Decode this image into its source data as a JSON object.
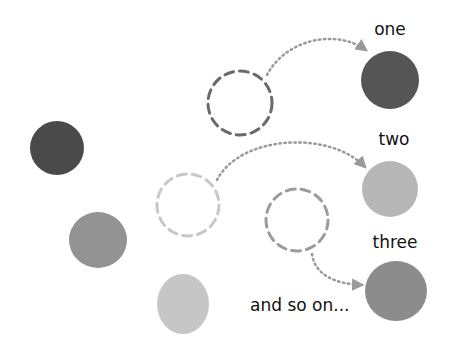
{
  "diagram": {
    "colors": {
      "background": "#ffffff",
      "dark": "#4a4a4a",
      "medium": "#8f8f8f",
      "light": "#c4c4c4",
      "target_one": "#555555",
      "target_two": "#b7b7b7",
      "target_three": "#8c8c8c",
      "dash_dark": "#6a6a6a",
      "dash_light": "#c8c8c8",
      "dash_medium": "#9c9c9c",
      "arrow": "#999999",
      "text": "#111111"
    },
    "source_circles": [
      {
        "id": "dark",
        "cx": 57,
        "cy": 148,
        "rx": 27,
        "ry": 27,
        "color": "#4a4a4a"
      },
      {
        "id": "medium",
        "cx": 98,
        "cy": 240,
        "rx": 29,
        "ry": 28,
        "color": "#939393"
      },
      {
        "id": "light",
        "cx": 183,
        "cy": 304,
        "rx": 26,
        "ry": 30,
        "color": "#c6c6c6"
      }
    ],
    "placeholder_circles": [
      {
        "id": "dashed-one",
        "cx": 240,
        "cy": 103,
        "r": 32,
        "color": "#6a6a6a"
      },
      {
        "id": "dashed-two",
        "cx": 188,
        "cy": 205,
        "r": 31,
        "color": "#c8c8c8"
      },
      {
        "id": "dashed-three",
        "cx": 297,
        "cy": 220,
        "r": 31,
        "color": "#9c9c9c"
      }
    ],
    "target_circles": [
      {
        "id": "one",
        "cx": 390,
        "cy": 80,
        "r": 29,
        "color": "#555555"
      },
      {
        "id": "two",
        "cx": 390,
        "cy": 189,
        "r": 28,
        "color": "#b7b7b7"
      },
      {
        "id": "three",
        "cx": 396,
        "cy": 291,
        "r": 30,
        "color": "#8c8c8c"
      }
    ],
    "labels": {
      "one": "one",
      "two": "two",
      "three": "three",
      "and_so_on": "and so on..."
    }
  }
}
